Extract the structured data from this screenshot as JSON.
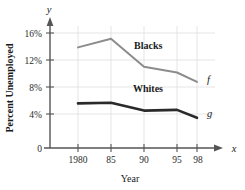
{
  "chart_data": {
    "type": "line",
    "title": "",
    "xlabel": "Year",
    "ylabel": "Percent Unemployed",
    "x": [
      1980,
      85,
      90,
      95,
      98
    ],
    "xtick_labels": [
      "1980",
      "85",
      "90",
      "95",
      "98"
    ],
    "ytick_labels": [
      "0",
      "4%",
      "8%",
      "12%",
      "16%"
    ],
    "ytick_values": [
      0,
      4,
      8,
      12,
      16
    ],
    "ylim": [
      0,
      17.5
    ],
    "xlim": [
      1978.5,
      99.5
    ],
    "grid": true,
    "legend": "inline-annotations",
    "axis_vars": {
      "x": "x",
      "y": "y"
    },
    "series": [
      {
        "name": "Blacks",
        "function_label": "f",
        "color": "#8c8c8c",
        "width": 2.0,
        "values": [
          14.0,
          15.2,
          11.3,
          10.5,
          9.2
        ]
      },
      {
        "name": "Whites",
        "function_label": "g",
        "color": "#2a2a2a",
        "width": 2.6,
        "values": [
          6.2,
          6.3,
          5.2,
          5.3,
          4.2
        ]
      }
    ],
    "annotations": [
      {
        "text": "Blacks",
        "x": 88.5,
        "y": 13.6
      },
      {
        "text": "Whites",
        "x": 88.5,
        "y": 7.3
      }
    ]
  },
  "colors": {
    "axis": "#555555",
    "grid": "#dddddd",
    "text": "#1a1a1a",
    "blacks_line": "#8c8c8c",
    "whites_line": "#2a2a2a",
    "background": "#ffffff"
  }
}
